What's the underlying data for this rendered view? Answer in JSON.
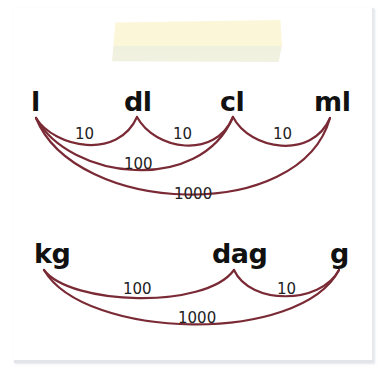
{
  "diagram": {
    "colors": {
      "arc": "#7a2a35",
      "text": "#111111",
      "tape": "#fbf6d6",
      "paper": "#ffffff"
    },
    "volume": {
      "units": [
        {
          "label": "l"
        },
        {
          "label": "dl"
        },
        {
          "label": "cl"
        },
        {
          "label": "ml"
        }
      ],
      "conversions": [
        {
          "from": "l",
          "to": "dl",
          "factor": "10"
        },
        {
          "from": "dl",
          "to": "cl",
          "factor": "10"
        },
        {
          "from": "cl",
          "to": "ml",
          "factor": "10"
        },
        {
          "from": "l",
          "to": "cl",
          "factor": "100"
        },
        {
          "from": "l",
          "to": "ml",
          "factor": "1000"
        }
      ]
    },
    "mass": {
      "units": [
        {
          "label": "kg"
        },
        {
          "label": "dag"
        },
        {
          "label": "g"
        }
      ],
      "conversions": [
        {
          "from": "kg",
          "to": "dag",
          "factor": "100"
        },
        {
          "from": "dag",
          "to": "g",
          "factor": "10"
        },
        {
          "from": "kg",
          "to": "g",
          "factor": "1000"
        }
      ]
    }
  }
}
